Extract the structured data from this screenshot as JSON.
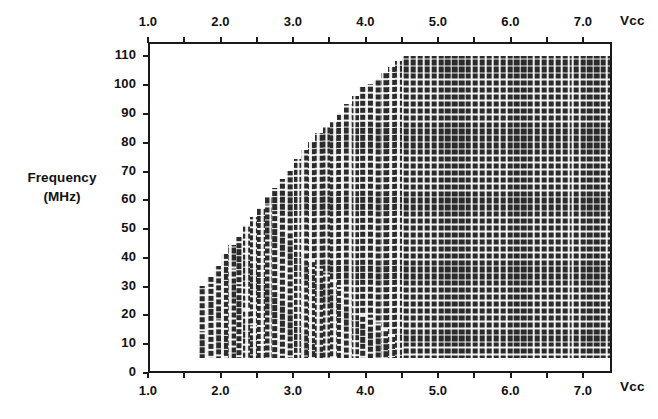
{
  "chart_data": {
    "type": "area",
    "title": "",
    "subtitle": "",
    "xlabel": "Vcc",
    "ylabel_line1": "Frequency",
    "ylabel_line2": "(MHz)",
    "xlabel_top": "Vcc",
    "xlabel_bottom": "Vcc",
    "grid": false,
    "legend": "none",
    "xlim": [
      1.0,
      7.4
    ],
    "ylim": [
      0,
      115
    ],
    "x_major_ticks": [
      1.0,
      2.0,
      3.0,
      4.0,
      5.0,
      6.0,
      7.0
    ],
    "x_major_tick_labels": [
      "1.0",
      "2.0",
      "3.0",
      "4.0",
      "5.0",
      "6.0",
      "7.0"
    ],
    "x_minor_ticks": [
      1.5,
      2.5,
      3.5,
      4.5,
      5.5,
      6.5,
      7.0
    ],
    "x_tick_step": 0.5,
    "y_ticks": [
      0,
      10,
      20,
      30,
      40,
      50,
      60,
      70,
      80,
      90,
      100,
      110
    ],
    "y_tick_labels": [
      "0",
      "10",
      "20",
      "30",
      "40",
      "50",
      "60",
      "70",
      "80",
      "90",
      "100",
      "110"
    ],
    "region_name": "valid operating region",
    "region_fill": "#2b2b2b",
    "region_pattern": "crosshatch-grid",
    "region_floor_mhz": 6,
    "region_ceiling_mhz": 111,
    "region_x_start": 1.68,
    "region_x_end": 7.38,
    "region_plateau_x": 4.42,
    "boundary_points": [
      {
        "vcc": 1.68,
        "fmax": 31
      },
      {
        "vcc": 1.78,
        "fmax": 34
      },
      {
        "vcc": 1.88,
        "fmax": 38
      },
      {
        "vcc": 1.98,
        "fmax": 42
      },
      {
        "vcc": 2.08,
        "fmax": 45
      },
      {
        "vcc": 2.18,
        "fmax": 48
      },
      {
        "vcc": 2.28,
        "fmax": 52
      },
      {
        "vcc": 2.38,
        "fmax": 55
      },
      {
        "vcc": 2.48,
        "fmax": 58
      },
      {
        "vcc": 2.58,
        "fmax": 62
      },
      {
        "vcc": 2.68,
        "fmax": 65
      },
      {
        "vcc": 2.78,
        "fmax": 68
      },
      {
        "vcc": 2.88,
        "fmax": 71
      },
      {
        "vcc": 2.98,
        "fmax": 75
      },
      {
        "vcc": 3.08,
        "fmax": 78
      },
      {
        "vcc": 3.18,
        "fmax": 81
      },
      {
        "vcc": 3.28,
        "fmax": 84
      },
      {
        "vcc": 3.38,
        "fmax": 86
      },
      {
        "vcc": 3.48,
        "fmax": 88
      },
      {
        "vcc": 3.58,
        "fmax": 91
      },
      {
        "vcc": 3.68,
        "fmax": 94
      },
      {
        "vcc": 3.78,
        "fmax": 97
      },
      {
        "vcc": 3.88,
        "fmax": 100
      },
      {
        "vcc": 3.98,
        "fmax": 101
      },
      {
        "vcc": 4.08,
        "fmax": 103
      },
      {
        "vcc": 4.18,
        "fmax": 105
      },
      {
        "vcc": 4.28,
        "fmax": 107
      },
      {
        "vcc": 4.38,
        "fmax": 109
      },
      {
        "vcc": 4.48,
        "fmax": 111
      },
      {
        "vcc": 7.38,
        "fmax": 111
      }
    ]
  }
}
